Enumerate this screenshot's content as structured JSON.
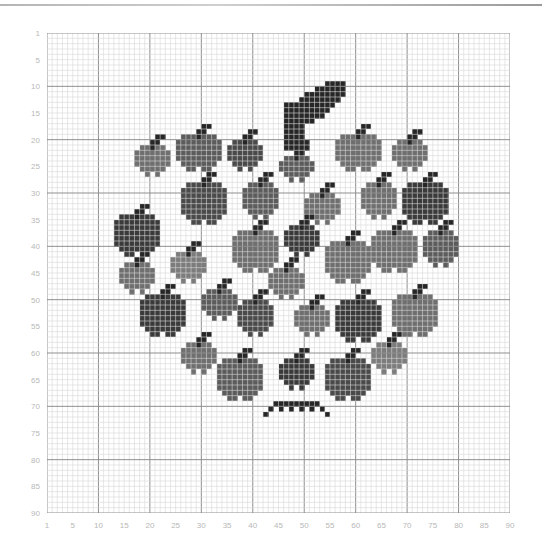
{
  "chart": {
    "title": "",
    "grid": {
      "cols": 90,
      "rows": 90
    },
    "x_labels": [
      "1",
      "5",
      "10",
      "15",
      "20",
      "25",
      "30",
      "35",
      "40",
      "45",
      "50",
      "55",
      "60",
      "65",
      "70",
      "75",
      "80",
      "85",
      "90"
    ],
    "y_labels": [
      "1",
      "5",
      "10",
      "15",
      "20",
      "25",
      "30",
      "35",
      "40",
      "45",
      "50",
      "55",
      "60",
      "65",
      "70",
      "75",
      "80",
      "85",
      "90"
    ]
  },
  "colors": {
    "background": "#ffffff",
    "grid_minor": "#d6d6d6",
    "grid_major": "#8f8f8f",
    "label": "#b8b8b8",
    "shades": [
      "#3a3a3a",
      "#4a4a4a",
      "#5c5c5c",
      "#6f6f6f",
      "#7c7c7c"
    ],
    "stem": "#262626"
  },
  "stem": {
    "cells": [
      [
        55,
        10
      ],
      [
        56,
        10
      ],
      [
        57,
        10
      ],
      [
        58,
        10
      ],
      [
        53,
        11
      ],
      [
        54,
        11
      ],
      [
        55,
        11
      ],
      [
        56,
        11
      ],
      [
        57,
        11
      ],
      [
        58,
        11
      ],
      [
        51,
        12
      ],
      [
        52,
        12
      ],
      [
        53,
        12
      ],
      [
        54,
        12
      ],
      [
        55,
        12
      ],
      [
        56,
        12
      ],
      [
        57,
        12
      ],
      [
        58,
        12
      ],
      [
        50,
        13
      ],
      [
        51,
        13
      ],
      [
        52,
        13
      ],
      [
        53,
        13
      ],
      [
        54,
        13
      ],
      [
        55,
        13
      ],
      [
        56,
        13
      ],
      [
        57,
        13
      ],
      [
        47,
        14
      ],
      [
        48,
        14
      ],
      [
        49,
        14
      ],
      [
        50,
        14
      ],
      [
        51,
        14
      ],
      [
        52,
        14
      ],
      [
        53,
        14
      ],
      [
        54,
        14
      ],
      [
        55,
        14
      ],
      [
        56,
        14
      ],
      [
        47,
        15
      ],
      [
        48,
        15
      ],
      [
        49,
        15
      ],
      [
        50,
        15
      ],
      [
        51,
        15
      ],
      [
        52,
        15
      ],
      [
        53,
        15
      ],
      [
        54,
        15
      ],
      [
        55,
        15
      ],
      [
        47,
        16
      ],
      [
        48,
        16
      ],
      [
        49,
        16
      ],
      [
        50,
        16
      ],
      [
        51,
        16
      ],
      [
        52,
        16
      ],
      [
        53,
        16
      ],
      [
        54,
        16
      ],
      [
        47,
        17
      ],
      [
        48,
        17
      ],
      [
        49,
        17
      ],
      [
        50,
        17
      ],
      [
        51,
        17
      ],
      [
        52,
        17
      ],
      [
        47,
        18
      ],
      [
        48,
        18
      ],
      [
        49,
        18
      ],
      [
        50,
        18
      ],
      [
        47,
        19
      ],
      [
        48,
        19
      ],
      [
        49,
        19
      ],
      [
        50,
        19
      ],
      [
        47,
        20
      ],
      [
        48,
        20
      ],
      [
        49,
        20
      ],
      [
        50,
        20
      ],
      [
        47,
        21
      ],
      [
        48,
        21
      ],
      [
        49,
        21
      ],
      [
        50,
        21
      ],
      [
        51,
        21
      ],
      [
        47,
        22
      ],
      [
        48,
        22
      ],
      [
        49,
        22
      ],
      [
        50,
        22
      ],
      [
        51,
        22
      ]
    ]
  },
  "apples": [
    {
      "c": 18,
      "r": 22,
      "w": 7,
      "h": 6,
      "shade": 3
    },
    {
      "c": 26,
      "r": 20,
      "w": 9,
      "h": 7,
      "shade": 2
    },
    {
      "c": 36,
      "r": 21,
      "w": 7,
      "h": 6,
      "shade": 1
    },
    {
      "c": 46,
      "r": 24,
      "w": 7,
      "h": 5,
      "shade": 2
    },
    {
      "c": 57,
      "r": 20,
      "w": 9,
      "h": 7,
      "shade": 3
    },
    {
      "c": 68,
      "r": 21,
      "w": 7,
      "h": 6,
      "shade": 3
    },
    {
      "c": 27,
      "r": 29,
      "w": 9,
      "h": 8,
      "shade": 1
    },
    {
      "c": 39,
      "r": 29,
      "w": 7,
      "h": 7,
      "shade": 2
    },
    {
      "c": 51,
      "r": 31,
      "w": 7,
      "h": 6,
      "shade": 3
    },
    {
      "c": 62,
      "r": 29,
      "w": 7,
      "h": 7,
      "shade": 3
    },
    {
      "c": 70,
      "r": 29,
      "w": 9,
      "h": 8,
      "shade": 0
    },
    {
      "c": 14,
      "r": 35,
      "w": 9,
      "h": 8,
      "shade": 0
    },
    {
      "c": 37,
      "r": 38,
      "w": 9,
      "h": 8,
      "shade": 3
    },
    {
      "c": 47,
      "r": 37,
      "w": 7,
      "h": 6,
      "shade": 0
    },
    {
      "c": 55,
      "r": 40,
      "w": 9,
      "h": 8,
      "shade": 3
    },
    {
      "c": 64,
      "r": 38,
      "w": 9,
      "h": 8,
      "shade": 3
    },
    {
      "c": 74,
      "r": 38,
      "w": 7,
      "h": 7,
      "shade": 2
    },
    {
      "c": 15,
      "r": 44,
      "w": 7,
      "h": 6,
      "shade": 3
    },
    {
      "c": 25,
      "r": 42,
      "w": 7,
      "h": 6,
      "shade": 4
    },
    {
      "c": 44,
      "r": 45,
      "w": 7,
      "h": 6,
      "shade": 3
    },
    {
      "c": 31,
      "r": 49,
      "w": 7,
      "h": 6,
      "shade": 2
    },
    {
      "c": 19,
      "r": 50,
      "w": 9,
      "h": 8,
      "shade": 0
    },
    {
      "c": 38,
      "r": 51,
      "w": 7,
      "h": 7,
      "shade": 1
    },
    {
      "c": 49,
      "r": 52,
      "w": 7,
      "h": 6,
      "shade": 3
    },
    {
      "c": 57,
      "r": 51,
      "w": 9,
      "h": 8,
      "shade": 0
    },
    {
      "c": 68,
      "r": 50,
      "w": 9,
      "h": 8,
      "shade": 3
    },
    {
      "c": 27,
      "r": 59,
      "w": 7,
      "h": 6,
      "shade": 3
    },
    {
      "c": 34,
      "r": 62,
      "w": 9,
      "h": 8,
      "shade": 2
    },
    {
      "c": 46,
      "r": 62,
      "w": 7,
      "h": 6,
      "shade": 0
    },
    {
      "c": 55,
      "r": 62,
      "w": 9,
      "h": 8,
      "shade": 1
    },
    {
      "c": 64,
      "r": 59,
      "w": 7,
      "h": 6,
      "shade": 4
    }
  ],
  "bottom_fringe": {
    "cells": [
      [
        44,
        71
      ],
      [
        45,
        70
      ],
      [
        46,
        70
      ],
      [
        47,
        70
      ],
      [
        48,
        70
      ],
      [
        49,
        70
      ],
      [
        50,
        70
      ],
      [
        51,
        70
      ],
      [
        52,
        70
      ],
      [
        53,
        70
      ],
      [
        43,
        72
      ],
      [
        46,
        71
      ],
      [
        48,
        71
      ],
      [
        50,
        71
      ],
      [
        52,
        71
      ],
      [
        54,
        71
      ],
      [
        55,
        72
      ]
    ]
  }
}
